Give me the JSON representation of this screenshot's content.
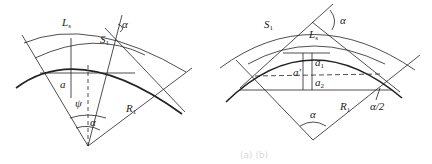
{
  "left_diagram": {
    "labels": {
      "L_s": "L",
      "L_s_sub": "s",
      "S1": "S",
      "S1_sub": "1",
      "alpha_top": "α",
      "a": "a",
      "psi": "ψ",
      "alpha_center": "α",
      "R1": "R",
      "R1_sub": "1"
    }
  },
  "right_diagram": {
    "labels": {
      "S1": "S",
      "S1_sub": "1",
      "alpha_top": "α",
      "L_s": "L",
      "L_s_sub": "s",
      "a_prime": "a'",
      "a1": "a",
      "a1_sub": "1",
      "a2": "a",
      "a2_sub": "2",
      "R1": "R",
      "R1_sub": "1",
      "half_alpha": "α/2",
      "alpha_center": "α"
    }
  },
  "caption": "(a) (b)"
}
